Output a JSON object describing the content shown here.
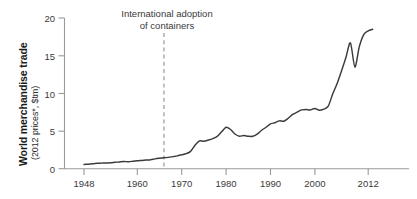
{
  "chart_data": {
    "type": "line",
    "title": "",
    "subtitle": "",
    "xlabel": "",
    "ylabel": "World merchandise trade",
    "ylabel_sub": "(2012 prices*, $tm)",
    "xlim": [
      1946,
      2015
    ],
    "ylim": [
      0,
      20
    ],
    "grid": false,
    "legend_position": "none",
    "x_ticks": [
      1948,
      1960,
      1970,
      1980,
      1990,
      2000,
      2012
    ],
    "x_tick_labels": [
      "1948",
      "1960",
      "1970",
      "1980",
      "1990",
      "2000",
      "2012"
    ],
    "y_ticks": [
      0,
      5,
      10,
      15,
      20
    ],
    "y_tick_labels": [
      "0",
      "5",
      "10",
      "15",
      "20"
    ],
    "line_color": "#3b3b3b",
    "axis_color": "#9a9a9a",
    "annotations": [
      {
        "text_lines": [
          "International adoption",
          "of containers"
        ],
        "marker_type": "dashed-vertical-line",
        "marker_x": 1966,
        "marker_color": "#9a9a9a"
      }
    ],
    "series": [
      {
        "name": "World merchandise trade",
        "x": [
          1948,
          1949,
          1950,
          1951,
          1952,
          1953,
          1954,
          1955,
          1956,
          1957,
          1958,
          1959,
          1960,
          1961,
          1962,
          1963,
          1964,
          1965,
          1966,
          1967,
          1968,
          1969,
          1970,
          1971,
          1972,
          1973,
          1974,
          1975,
          1976,
          1977,
          1978,
          1979,
          1980,
          1981,
          1982,
          1983,
          1984,
          1985,
          1986,
          1987,
          1988,
          1989,
          1990,
          1991,
          1992,
          1993,
          1994,
          1995,
          1996,
          1997,
          1998,
          1999,
          2000,
          2001,
          2002,
          2003,
          2004,
          2005,
          2006,
          2007,
          2008,
          2009,
          2010,
          2011,
          2012,
          2013
        ],
        "y": [
          0.55,
          0.6,
          0.65,
          0.72,
          0.74,
          0.76,
          0.8,
          0.85,
          0.9,
          0.95,
          0.93,
          0.98,
          1.05,
          1.1,
          1.15,
          1.2,
          1.3,
          1.38,
          1.45,
          1.5,
          1.6,
          1.7,
          1.85,
          2.0,
          2.3,
          3.1,
          3.7,
          3.65,
          3.8,
          4.0,
          4.3,
          4.9,
          5.5,
          5.2,
          4.6,
          4.3,
          4.4,
          4.3,
          4.3,
          4.6,
          5.1,
          5.5,
          5.95,
          6.1,
          6.35,
          6.3,
          6.7,
          7.2,
          7.5,
          7.8,
          7.85,
          7.8,
          8.0,
          7.75,
          7.9,
          8.3,
          9.9,
          11.3,
          13.0,
          14.8,
          16.7,
          13.5,
          16.2,
          17.8,
          18.3,
          18.5
        ]
      }
    ]
  },
  "y_axis": {
    "title_main": "World merchandise trade",
    "title_sub": "(2012 prices*, $tm)",
    "ticks": [
      {
        "label": "20",
        "value": 20
      },
      {
        "label": "15",
        "value": 15
      },
      {
        "label": "10",
        "value": 10
      },
      {
        "label": "5",
        "value": 5
      },
      {
        "label": "0",
        "value": 0
      }
    ]
  },
  "x_axis": {
    "ticks": [
      {
        "label": "1948",
        "value": 1948
      },
      {
        "label": "1960",
        "value": 1960
      },
      {
        "label": "1970",
        "value": 1970
      },
      {
        "label": "1980",
        "value": 1980
      },
      {
        "label": "1990",
        "value": 1990
      },
      {
        "label": "2000",
        "value": 2000
      },
      {
        "label": "2012",
        "value": 2012
      }
    ]
  },
  "annotation": {
    "line1": "International adoption",
    "line2": "of containers"
  }
}
